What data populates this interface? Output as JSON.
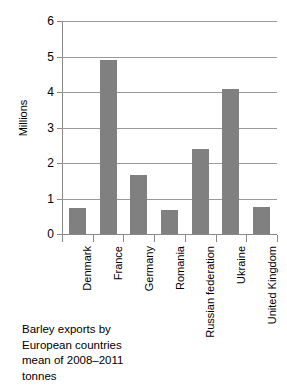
{
  "chart_data": {
    "type": "bar",
    "title": "",
    "xlabel": "",
    "ylabel": "Millions",
    "ylim": [
      0,
      6
    ],
    "yticks": [
      "0",
      "1",
      "2",
      "3",
      "4",
      "5",
      "6"
    ],
    "grid": true,
    "legend": "none",
    "bar_color": "#808080",
    "categories": [
      "Denmark",
      "France",
      "Germany",
      "Romania",
      "Russian federation",
      "Ukraine",
      "United Kingdom"
    ],
    "values": [
      0.74,
      4.89,
      1.65,
      0.69,
      2.39,
      4.09,
      0.77
    ],
    "series": [
      {
        "name": "Barley exports",
        "values": [
          0.74,
          4.89,
          1.65,
          0.69,
          2.39,
          4.09,
          0.77
        ]
      }
    ]
  },
  "caption": {
    "line1": "Barley exports by",
    "line2": "European countries",
    "line3": "mean of 2008–2011",
    "line4": "tonnes"
  }
}
